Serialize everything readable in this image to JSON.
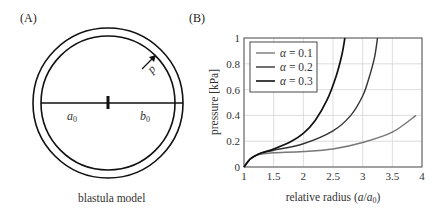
{
  "panelA": {
    "label": "(A)",
    "caption": "blastula model",
    "inner_radius_label": "a",
    "inner_radius_sub": "0",
    "outer_radius_label": "b",
    "outer_radius_sub": "0",
    "pressure_label": "p"
  },
  "panelB": {
    "label": "(B)",
    "xlabel_prefix": "relative radius (",
    "xlabel_a": "a",
    "xlabel_slash": "/",
    "xlabel_a0": "a",
    "xlabel_sub": "0",
    "xlabel_suffix": ")",
    "ylabel": "pressure [kPa]",
    "xticks": [
      "1",
      "1.5",
      "2",
      "2.5",
      "3",
      "3.5",
      "4"
    ],
    "yticks": [
      "0",
      "0.2",
      "0.4",
      "0.6",
      "0.8",
      "1"
    ],
    "legend": [
      {
        "symbol": "α",
        "text": " = 0.1"
      },
      {
        "symbol": "α",
        "text": " = 0.2"
      },
      {
        "symbol": "α",
        "text": " = 0.3"
      }
    ]
  },
  "chart_data": {
    "type": "line",
    "title": "",
    "xlabel": "relative radius (a/a0)",
    "ylabel": "pressure [kPa]",
    "xlim": [
      1,
      4
    ],
    "ylim": [
      0,
      1
    ],
    "grid": true,
    "legend_position": "upper left",
    "series": [
      {
        "name": "α = 0.1",
        "color": "#777777",
        "x": [
          1.0,
          1.1,
          1.2,
          1.3,
          1.5,
          2.0,
          2.5,
          3.0,
          3.5,
          3.9
        ],
        "y": [
          0.0,
          0.06,
          0.09,
          0.1,
          0.11,
          0.12,
          0.14,
          0.19,
          0.27,
          0.4
        ]
      },
      {
        "name": "α = 0.2",
        "color": "#333333",
        "x": [
          1.0,
          1.1,
          1.2,
          1.3,
          1.5,
          2.0,
          2.5,
          2.8,
          3.0,
          3.1,
          3.2,
          3.25
        ],
        "y": [
          0.0,
          0.06,
          0.09,
          0.11,
          0.13,
          0.18,
          0.28,
          0.4,
          0.55,
          0.68,
          0.85,
          1.0
        ]
      },
      {
        "name": "α = 0.3",
        "color": "#111111",
        "x": [
          1.0,
          1.1,
          1.2,
          1.3,
          1.5,
          1.8,
          2.0,
          2.2,
          2.4,
          2.55,
          2.65,
          2.7
        ],
        "y": [
          0.0,
          0.06,
          0.09,
          0.11,
          0.14,
          0.2,
          0.26,
          0.36,
          0.52,
          0.7,
          0.87,
          1.0
        ]
      }
    ]
  }
}
